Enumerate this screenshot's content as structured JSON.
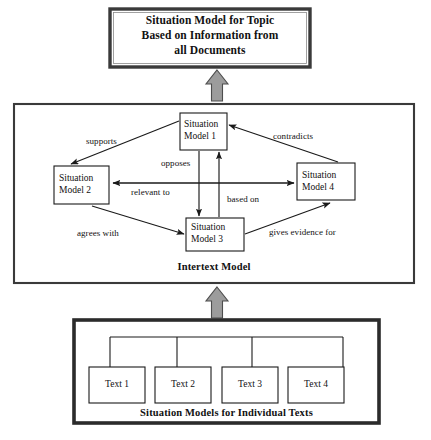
{
  "diagram": {
    "title_banner": {
      "lines": [
        "Situation Model for Topic",
        "Based on Information from",
        "all Documents"
      ]
    },
    "intertext_section": {
      "caption": "Intertext Model",
      "nodes": [
        {
          "id": "sm1",
          "line1": "Situation",
          "line2": "Model 1"
        },
        {
          "id": "sm2",
          "line1": "Situation",
          "line2": "Model 2"
        },
        {
          "id": "sm3",
          "line1": "Situation",
          "line2": "Model 3"
        },
        {
          "id": "sm4",
          "line1": "Situation",
          "line2": "Model 4"
        }
      ],
      "relations": [
        {
          "id": "r1",
          "label": "supports",
          "from": "sm1",
          "to": "sm2"
        },
        {
          "id": "r2",
          "label": "contradicts",
          "from": "sm4",
          "to": "sm1"
        },
        {
          "id": "r3",
          "label": "opposes",
          "from": "sm1",
          "to": "sm3"
        },
        {
          "id": "r4",
          "label": "relevant to",
          "from": "sm4",
          "to": "sm2"
        },
        {
          "id": "r5",
          "label": "based on",
          "from": "sm3",
          "to": "sm1"
        },
        {
          "id": "r6",
          "label": "agrees with",
          "from": "sm2",
          "to": "sm3"
        },
        {
          "id": "r7",
          "label": "gives evidence for",
          "from": "sm3",
          "to": "sm4"
        }
      ]
    },
    "texts_section": {
      "caption": "Situation Models for Individual Texts",
      "nodes": [
        {
          "id": "t1",
          "label": "Text 1"
        },
        {
          "id": "t2",
          "label": "Text 2"
        },
        {
          "id": "t3",
          "label": "Text 3"
        },
        {
          "id": "t4",
          "label": "Text 4"
        }
      ]
    },
    "flow_arrows": [
      {
        "id": "arrow-texts-to-intertext",
        "direction": "up"
      },
      {
        "id": "arrow-intertext-to-banner",
        "direction": "up"
      }
    ],
    "colors": {
      "line": "#1a1a1a",
      "frame": "#333333",
      "block_arrow_fill": "#9c9c9c",
      "block_arrow_stroke": "#4d4d4d",
      "background": "#ffffff"
    }
  }
}
